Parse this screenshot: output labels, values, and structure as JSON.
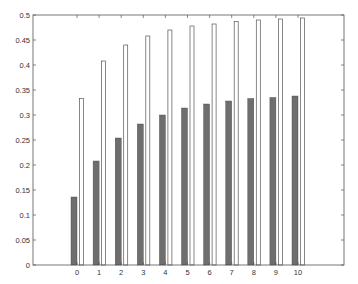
{
  "chart_data": {
    "type": "bar",
    "title": "",
    "xlabel": "",
    "ylabel": "",
    "categories": [
      "0",
      "1",
      "2",
      "3",
      "4",
      "5",
      "6",
      "7",
      "8",
      "9",
      "10"
    ],
    "series": [
      {
        "name": "series-dark",
        "color": "#6e6e6e",
        "values": [
          0.136,
          0.208,
          0.254,
          0.282,
          0.3,
          0.314,
          0.322,
          0.328,
          0.333,
          0.335,
          0.338
        ]
      },
      {
        "name": "series-white",
        "color": "#ffffff",
        "values": [
          0.333,
          0.408,
          0.44,
          0.458,
          0.47,
          0.478,
          0.482,
          0.487,
          0.49,
          0.492,
          0.494
        ]
      }
    ],
    "ylim": [
      0,
      0.5
    ],
    "xlim": [
      -3.5,
      12
    ],
    "yticks": [
      "0",
      "0.05",
      "0.1",
      "0.15",
      "0.2",
      "0.25",
      "0.3",
      "0.35",
      "0.4",
      "0.45",
      "0.5"
    ],
    "grid": false,
    "legend": null
  }
}
